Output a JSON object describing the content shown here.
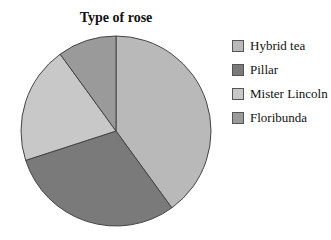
{
  "chart_data": {
    "type": "pie",
    "title": "Type of rose",
    "categories": [
      "Hybrid tea",
      "Pillar",
      "Mister Lincoln",
      "Floribunda"
    ],
    "values": [
      40,
      30,
      20,
      10
    ],
    "colors": [
      "#b9b9b9",
      "#7a7a7a",
      "#c8c8c8",
      "#9a9a9a"
    ],
    "start_angle_deg": 0,
    "direction": "clockwise",
    "legend_position": "right"
  }
}
